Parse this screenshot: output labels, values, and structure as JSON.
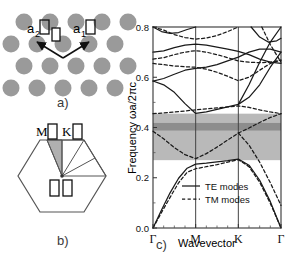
{
  "figure": {
    "panels": [
      {
        "tag": "a)",
        "caption": "triangular-lattice-schematic"
      },
      {
        "tag": "b)",
        "caption": "brillouin-zone-schematic"
      },
      {
        "tag": "c)",
        "caption": "photonic-band-structure"
      }
    ]
  },
  "panel_a": {
    "tag": "a)",
    "lattice_vector_1": "a",
    "lattice_vector_1_sub": "1",
    "lattice_vector_2": "a",
    "lattice_vector_2_sub": "2",
    "rod_color": "#9a9a9a",
    "n_rows": 4,
    "n_cols": 4
  },
  "panel_b": {
    "tag": "b)",
    "point_m": "M",
    "point_k": "K",
    "point_gamma": "Γ",
    "wedge_color": "#b0b0b0",
    "outline_color": "#555555"
  },
  "chart_data": {
    "type": "line",
    "title": "",
    "xlabel": "Wavevector",
    "ylabel": "Frequency  ωa/2πc",
    "ylim": [
      0.0,
      0.8
    ],
    "yticks": [
      0.0,
      0.2,
      0.4,
      0.6,
      0.8
    ],
    "yticklabels": [
      "0.0",
      "0.2",
      "0.4",
      "0.6",
      "0.8"
    ],
    "xticks": [
      0,
      1,
      2,
      3
    ],
    "xticklabels": [
      "Γ",
      "M",
      "K",
      "Γ"
    ],
    "grid": false,
    "legend_position": "lower-center",
    "legend": [
      {
        "label": "TE modes",
        "style": "solid"
      },
      {
        "label": "TM modes",
        "style": "dashed"
      }
    ],
    "shaded_regions": [
      {
        "name": "te-band-gap",
        "y0": 0.27,
        "y1": 0.455,
        "color": "#b9b9b9"
      },
      {
        "name": "complete-band-gap",
        "y0": 0.388,
        "y1": 0.418,
        "color": "#8d8d8d"
      }
    ],
    "x_segments": [
      "Γ-M",
      "M-K",
      "K-Γ"
    ],
    "x_nodes": [
      0.0,
      1.0,
      2.0,
      3.0
    ],
    "series": [
      {
        "name": "TE band 1",
        "style": "solid",
        "x": [
          0.0,
          0.2,
          0.4,
          0.6,
          0.8,
          1.0,
          1.25,
          1.5,
          1.75,
          2.0,
          2.25,
          2.5,
          2.75,
          3.0
        ],
        "y": [
          0.0,
          0.072,
          0.14,
          0.198,
          0.238,
          0.254,
          0.258,
          0.263,
          0.268,
          0.274,
          0.25,
          0.19,
          0.105,
          0.0
        ]
      },
      {
        "name": "TE band 2",
        "style": "solid",
        "x": [
          0.0,
          0.25,
          0.5,
          0.75,
          1.0,
          1.25,
          1.5,
          1.75,
          2.0,
          2.25,
          2.5,
          2.75,
          3.0
        ],
        "y": [
          0.585,
          0.57,
          0.54,
          0.495,
          0.456,
          0.462,
          0.472,
          0.482,
          0.492,
          0.52,
          0.57,
          0.64,
          0.7
        ]
      },
      {
        "name": "TE band 3",
        "style": "solid",
        "x": [
          0.0,
          0.25,
          0.5,
          0.75,
          1.0,
          1.25,
          1.5,
          1.75,
          2.0,
          2.25,
          2.5,
          2.75,
          3.0
        ],
        "y": [
          0.585,
          0.595,
          0.612,
          0.628,
          0.635,
          0.64,
          0.65,
          0.665,
          0.68,
          0.7,
          0.712,
          0.712,
          0.7
        ]
      },
      {
        "name": "TE band 4",
        "style": "solid",
        "x": [
          0.0,
          0.25,
          0.5,
          0.75,
          1.0,
          1.25,
          1.5,
          1.75,
          2.0,
          2.25,
          2.5,
          2.75,
          3.0
        ],
        "y": [
          0.7,
          0.705,
          0.718,
          0.728,
          0.732,
          0.728,
          0.72,
          0.712,
          0.703,
          0.69,
          0.672,
          0.66,
          0.655
        ]
      },
      {
        "name": "TE band 5",
        "style": "solid",
        "x": [
          0.0,
          0.2,
          0.4,
          0.6,
          0.8,
          1.0
        ],
        "y": [
          0.8,
          0.782,
          0.775,
          0.778,
          0.79,
          0.8
        ]
      },
      {
        "name": "TE band 6",
        "style": "solid",
        "x": [
          2.0,
          2.25,
          2.5,
          2.75,
          3.0
        ],
        "y": [
          0.492,
          0.57,
          0.66,
          0.74,
          0.8
        ]
      },
      {
        "name": "TE band 7",
        "style": "solid",
        "x": [
          2.3,
          2.5,
          2.7,
          2.9,
          3.0
        ],
        "y": [
          0.8,
          0.76,
          0.74,
          0.745,
          0.755
        ]
      },
      {
        "name": "TM band 1",
        "style": "dashed",
        "x": [
          0.0,
          0.2,
          0.4,
          0.6,
          0.8,
          1.0,
          1.25,
          1.5,
          1.75,
          2.0,
          2.25,
          2.5,
          2.75,
          3.0
        ],
        "y": [
          0.0,
          0.062,
          0.122,
          0.18,
          0.222,
          0.236,
          0.244,
          0.252,
          0.262,
          0.272,
          0.244,
          0.182,
          0.098,
          0.0
        ]
      },
      {
        "name": "TM band 2",
        "style": "dashed",
        "x": [
          0.0,
          0.25,
          0.5,
          0.75,
          1.0,
          1.25,
          1.5,
          1.75,
          2.0,
          2.25,
          2.5,
          2.75,
          3.0
        ],
        "y": [
          0.385,
          0.355,
          0.32,
          0.292,
          0.276,
          0.296,
          0.322,
          0.35,
          0.378,
          0.398,
          0.42,
          0.44,
          0.455
        ]
      },
      {
        "name": "TM band 3",
        "style": "dashed",
        "x": [
          0.0,
          0.25,
          0.5,
          0.75,
          1.0,
          1.25,
          1.5,
          1.75,
          2.0,
          2.25,
          2.5,
          2.75,
          3.0
        ],
        "y": [
          0.455,
          0.458,
          0.462,
          0.466,
          0.47,
          0.474,
          0.478,
          0.482,
          0.486,
          0.48,
          0.47,
          0.462,
          0.455
        ]
      },
      {
        "name": "TM band 4",
        "style": "dashed",
        "x": [
          0.0,
          0.25,
          0.5,
          0.75,
          1.0,
          1.25,
          1.5,
          1.75,
          2.0,
          2.25,
          2.5,
          2.75,
          3.0
        ],
        "y": [
          0.655,
          0.65,
          0.645,
          0.642,
          0.64,
          0.632,
          0.62,
          0.604,
          0.586,
          0.6,
          0.628,
          0.655,
          0.668
        ]
      },
      {
        "name": "TM band 5",
        "style": "dashed",
        "x": [
          0.0,
          0.25,
          0.5,
          0.75,
          1.0,
          1.25,
          1.5,
          1.75,
          2.0,
          2.25,
          2.5,
          2.75,
          3.0
        ],
        "y": [
          0.672,
          0.678,
          0.69,
          0.7,
          0.706,
          0.7,
          0.69,
          0.678,
          0.665,
          0.66,
          0.658,
          0.66,
          0.668
        ]
      },
      {
        "name": "TM band 6",
        "style": "dashed",
        "x": [
          0.0,
          0.25,
          0.5,
          0.75,
          1.0,
          1.25,
          1.5,
          1.75,
          2.0
        ],
        "y": [
          0.8,
          0.788,
          0.77,
          0.758,
          0.752,
          0.756,
          0.766,
          0.782,
          0.8
        ]
      },
      {
        "name": "TM band 7",
        "style": "dashed",
        "x": [
          2.0,
          2.25,
          2.5,
          2.75,
          3.0
        ],
        "y": [
          0.378,
          0.33,
          0.262,
          0.18,
          0.09
        ]
      },
      {
        "name": "TM band 8",
        "style": "dashed",
        "x": [
          2.55,
          2.75,
          3.0
        ],
        "y": [
          0.8,
          0.73,
          0.66
        ]
      }
    ]
  }
}
